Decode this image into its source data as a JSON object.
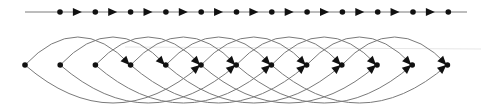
{
  "diagram": {
    "colors": {
      "edge": "#7a7a7a",
      "node": "#111111",
      "arrow": "#111111",
      "guide": "#e6e6e6"
    },
    "top_chain": {
      "y": 12,
      "line_x_start": 25,
      "line_x_end": 467,
      "node_x_start": 60,
      "node_spacing": 35.3,
      "node_count": 12
    },
    "bottom_graph": {
      "y": 65,
      "node_x_start": 25,
      "node_spacing": 35.2,
      "node_count": 13,
      "upper_arc_span": 3,
      "upper_arc_height": 28,
      "lower_arc_span": 5,
      "lower_arc_height": 38,
      "guide_y": 47
    }
  }
}
